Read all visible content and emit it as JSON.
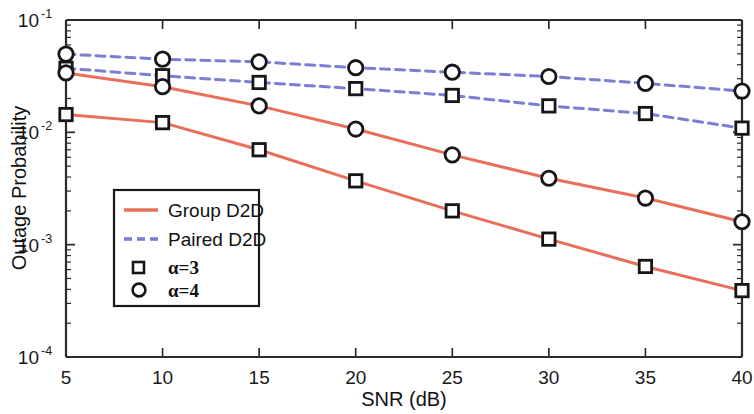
{
  "chart_data": {
    "type": "line",
    "title": "",
    "xlabel": "SNR (dB)",
    "ylabel": "Outage Probability",
    "xlim": [
      5,
      40
    ],
    "ylim": [
      0.0001,
      0.1
    ],
    "yscale": "log",
    "grid": false,
    "legend_position": "center-left",
    "x": [
      5,
      10,
      15,
      20,
      25,
      30,
      35,
      40
    ],
    "xticks": [
      "5",
      "10",
      "15",
      "20",
      "25",
      "30",
      "35",
      "40"
    ],
    "yticks": [
      "10",
      "10",
      "10",
      "10"
    ],
    "ytick_exponents": [
      "-1",
      "-2",
      "-3",
      "-4"
    ],
    "ytick_values": [
      0.1,
      0.01,
      0.001,
      0.0001
    ],
    "series": [
      {
        "name": "Paired D2D, α=4",
        "group": "Paired D2D",
        "alpha": 4,
        "color": "#7b7fd4",
        "linestyle": "dashed",
        "marker": "circle",
        "values": [
          0.0497,
          0.0448,
          0.0424,
          0.0376,
          0.0343,
          0.0314,
          0.0273,
          0.0233
        ]
      },
      {
        "name": "Paired D2D, α=3",
        "group": "Paired D2D",
        "alpha": 3,
        "color": "#7b7fd4",
        "linestyle": "dashed",
        "marker": "square",
        "values": [
          0.0372,
          0.0319,
          0.0278,
          0.0245,
          0.0213,
          0.0172,
          0.0147,
          0.0109
        ]
      },
      {
        "name": "Group D2D, α=4",
        "group": "Group D2D",
        "alpha": 4,
        "color": "#e8705a",
        "linestyle": "solid",
        "marker": "circle",
        "values": [
          0.0338,
          0.0255,
          0.0172,
          0.0107,
          0.0063,
          0.0039,
          0.0026,
          0.0016
        ]
      },
      {
        "name": "Group D2D, α=3",
        "group": "Group D2D",
        "alpha": 3,
        "color": "#e8705a",
        "linestyle": "solid",
        "marker": "square",
        "values": [
          0.0144,
          0.0122,
          0.007,
          0.0037,
          0.002,
          0.00112,
          0.00064,
          0.00039
        ]
      }
    ],
    "legend_entries": [
      {
        "label": "Group D2D",
        "type": "line",
        "color": "#e8705a",
        "linestyle": "solid"
      },
      {
        "label": "Paired D2D",
        "type": "line",
        "color": "#7b7fd4",
        "linestyle": "dashed"
      },
      {
        "label": "α=3",
        "type": "marker",
        "marker": "square"
      },
      {
        "label": "α=4",
        "type": "marker",
        "marker": "circle"
      }
    ]
  },
  "axes": {
    "x_title": "SNR (dB)",
    "y_title": "Outage Probability",
    "x_tick_labels": [
      "5",
      "10",
      "15",
      "20",
      "25",
      "30",
      "35",
      "40"
    ],
    "y_tick_mantissa": "10",
    "y_tick_exponents": [
      "-1",
      "-2",
      "-3",
      "-4"
    ]
  },
  "legend": {
    "row1_label": "Group D2D",
    "row2_label": "Paired D2D",
    "row3_label": "α=3",
    "row4_label": "α=4"
  },
  "colors": {
    "group_d2d": "#e8705a",
    "paired_d2d": "#7b7fd4",
    "axis": "#2b2b2b",
    "marker_edge": "#16161a",
    "background": "#ffffff"
  }
}
